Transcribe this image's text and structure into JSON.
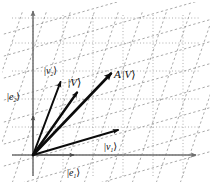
{
  "figure": {
    "background_color": "#ffffff",
    "width": 212,
    "height": 184,
    "axis_color": "#6e6e6e",
    "grid_color": "#9a9a9a",
    "skew_grid_color": "#8c8c8c",
    "vector_color": "#0b0b0b",
    "label_color": "#0b0b0b"
  },
  "axes": {
    "origin": {
      "x": 33,
      "y": 155
    },
    "x_axis": {
      "from_x": 12,
      "to_x": 198,
      "y": 155,
      "arrow": "right"
    },
    "y_axis": {
      "x": 33,
      "from_y": 176,
      "to_y": 8,
      "arrow": "up"
    },
    "labels": {
      "e1": {
        "bra": "|",
        "name": "e",
        "sub": "1",
        "ket": "⟩",
        "x": 72,
        "y": 173
      },
      "e2": {
        "bra": "|",
        "name": "e",
        "sub": "2",
        "ket": "⟩",
        "x": 7,
        "y": 97
      }
    },
    "basis_arrows": {
      "e1": {
        "x1": 33,
        "y1": 155,
        "x2": 78,
        "y2": 155
      },
      "e2": {
        "x1": 33,
        "y1": 155,
        "x2": 33,
        "y2": 112
      }
    }
  },
  "grid": {
    "type": "dotted-rectangular",
    "vertical_x": [
      33,
      63,
      93,
      123,
      153,
      183
    ],
    "horizontal_y": [
      155,
      127,
      99,
      71,
      43,
      18
    ],
    "dash": "1,2.2",
    "stroke_width": 0.8
  },
  "skew_grid": {
    "type": "dashed-sheared",
    "description": "Image of the rectangular grid under the linear map A: a steep family and a shallow family of parallel dashed lines.",
    "steep_family": {
      "count": 9,
      "slope_dx": 34,
      "slope_dy": -100,
      "spacing": 24
    },
    "shallow_family": {
      "count": 9,
      "slope_dx": 100,
      "slope_dy": -28,
      "spacing": 22
    },
    "dash": "2.4,2.4",
    "stroke_width": 0.75
  },
  "vectors": [
    {
      "id": "v2",
      "label": {
        "bra": "|",
        "name": "v",
        "sub": "2",
        "ket": "⟩"
      },
      "label_x": 46,
      "label_y": 72,
      "tip_x": 62,
      "tip_y": 78,
      "stroke_width": 2.0,
      "head_size": 5.2
    },
    {
      "id": "V",
      "label": {
        "bra": "|",
        "name": "V",
        "sub": "",
        "ket": "⟩"
      },
      "label_x": 71,
      "label_y": 84,
      "tip_x": 79,
      "tip_y": 89,
      "stroke_width": 2.4,
      "head_size": 5.6
    },
    {
      "id": "AV",
      "label": {
        "pre": "A",
        "bra": "|",
        "name": "V",
        "sub": "",
        "ket": "⟩"
      },
      "label_x": 116,
      "label_y": 76,
      "tip_x": 114,
      "tip_y": 69,
      "stroke_width": 2.6,
      "head_size": 6.2
    },
    {
      "id": "v1",
      "label": {
        "bra": "|",
        "name": "v",
        "sub": "1",
        "ket": "⟩"
      },
      "label_x": 106,
      "label_y": 147,
      "tip_x": 121,
      "tip_y": 127,
      "stroke_width": 2.0,
      "head_size": 5.2
    }
  ]
}
